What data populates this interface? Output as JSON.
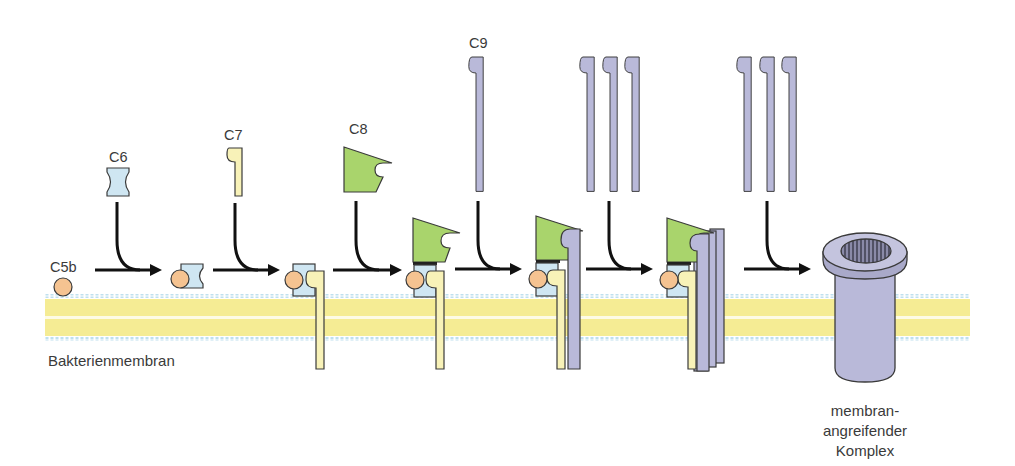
{
  "colors": {
    "c5b": "#f5c391",
    "c6": "#cfe6f2",
    "c7": "#f8f2b8",
    "c8": "#a9d46c",
    "c9": "#b9b9d9",
    "membrane_yellow": "#f8f0a0",
    "membrane_heads": "#bfe0ee",
    "outline": "#3a3a3a",
    "arrow": "#111111"
  },
  "labels": {
    "c5b": "C5b",
    "c6": "C6",
    "c7": "C7",
    "c8": "C8",
    "c9": "C9",
    "membrane": "Bakterienmembran",
    "mac_line1": "membran-",
    "mac_line2": "angreifender",
    "mac_line3": "Komplex"
  },
  "steps": [
    {
      "adds": "C6",
      "result": "C5b-6"
    },
    {
      "adds": "C7",
      "result": "C5b-7"
    },
    {
      "adds": "C8",
      "result": "C5b-8"
    },
    {
      "adds": "C9",
      "result": "C5b-9 (1 C9)"
    },
    {
      "adds": "C9 ×3",
      "result": "C5b-9 (mehrere C9)"
    },
    {
      "adds": "C9 ×3",
      "result": "membranangreifender Komplex"
    }
  ]
}
